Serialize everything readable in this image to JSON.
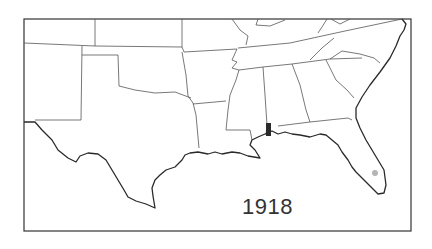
{
  "map": {
    "title": "Southeastern United States",
    "year": "1918",
    "regions": [
      "New Mexico",
      "Texas",
      "Oklahoma",
      "Arkansas",
      "Louisiana",
      "Mississippi",
      "Alabama",
      "Georgia",
      "Florida",
      "South Carolina",
      "North Carolina",
      "Tennessee"
    ],
    "markers": [
      {
        "type": "occurrence-area",
        "location": "Mobile, Alabama",
        "color": "#2b2b2b"
      },
      {
        "type": "occurrence-dot",
        "location": "South Florida",
        "color": "#b5b5b5"
      }
    ],
    "colors": {
      "background": "#ffffff",
      "borders": "#555555",
      "coast": "#2a2a2a"
    }
  }
}
